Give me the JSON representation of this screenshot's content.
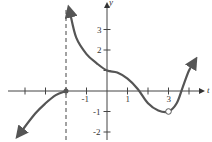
{
  "chart_data": {
    "type": "line",
    "title": "",
    "xlabel": "t",
    "ylabel": "y",
    "x_tick_labels": [
      "-1",
      "1",
      "3"
    ],
    "y_tick_labels": [
      "3",
      "2",
      "-1",
      "-2"
    ],
    "xlim": [
      -5,
      4.6
    ],
    "ylim": [
      -2.4,
      4
    ],
    "grid": false,
    "legend": null,
    "vertical_asymptote": {
      "x": -2,
      "style": "dashed"
    },
    "series": [
      {
        "name": "left branch",
        "points": [
          [
            -4.2,
            -2.0
          ],
          [
            -3.5,
            -1.1
          ],
          [
            -3.0,
            -0.6
          ],
          [
            -2.5,
            -0.2
          ],
          [
            -2.0,
            0.0
          ]
        ],
        "endpoint": {
          "x": -2,
          "y": 0,
          "type": "closed"
        },
        "arrow_start": true
      },
      {
        "name": "right branch",
        "points": [
          [
            -1.8,
            3.8
          ],
          [
            -1.5,
            2.6
          ],
          [
            -1.0,
            1.8
          ],
          [
            -0.5,
            1.35
          ],
          [
            0,
            1.0
          ],
          [
            0.5,
            0.9
          ],
          [
            1.0,
            0.6
          ],
          [
            1.5,
            0.1
          ],
          [
            2.0,
            -0.6
          ],
          [
            2.5,
            -0.95
          ],
          [
            3.0,
            -1.0
          ],
          [
            3.4,
            -0.6
          ],
          [
            3.7,
            0.2
          ],
          [
            4.0,
            1.0
          ],
          [
            4.3,
            1.5
          ]
        ],
        "hole": {
          "x": 3,
          "y": -1,
          "type": "open"
        },
        "arrow_start": true,
        "arrow_end": true
      }
    ]
  },
  "labels": {
    "x_axis": "t",
    "y_axis": "y",
    "xticks": [
      {
        "v": -1,
        "t": "-1"
      },
      {
        "v": 1,
        "t": "1"
      },
      {
        "v": 3,
        "t": "3"
      }
    ],
    "yticks": [
      {
        "v": 3,
        "t": "3"
      },
      {
        "v": 2,
        "t": "2"
      },
      {
        "v": -1,
        "t": "-1"
      },
      {
        "v": -2,
        "t": "-2"
      }
    ]
  }
}
